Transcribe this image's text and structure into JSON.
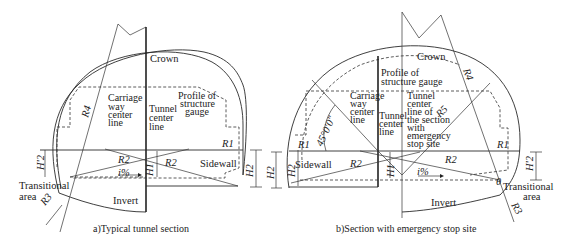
{
  "figure_a": {
    "caption": "a)Typical tunnel section",
    "labels": {
      "crown": "Crown",
      "carriage_way": [
        "Carriage",
        "way",
        "center",
        "line"
      ],
      "tunnel_center": [
        "Tunnel",
        "center",
        "line"
      ],
      "profile": [
        "Profile of",
        "structure",
        "gauge"
      ],
      "sidewall": "Sidewall",
      "transitional": [
        "Transitional",
        "area"
      ],
      "invert": "Invert",
      "slope": "i%",
      "r1": "R1",
      "r2_left": "R2",
      "r2_right": "R2",
      "r3": "R3",
      "r4": "R4",
      "h1": "H1",
      "h2": "H2",
      "h2_prime": "H'2",
      "h2_outer": "H2"
    }
  },
  "figure_b": {
    "caption": "b)Section with emergency stop site",
    "labels": {
      "crown": "Crown",
      "profile": [
        "Profile of",
        "structure gauge"
      ],
      "carriage_way": [
        "Carriage",
        "way",
        "center",
        "line"
      ],
      "tunnel_center": [
        "Tunnel",
        "center",
        "line"
      ],
      "tunnel_center_emergency": [
        "Tunnel",
        "center",
        "line of",
        "the section",
        "with",
        "emergency",
        "stop site"
      ],
      "angle": "45°0′0″",
      "sidewall": "Sidewall",
      "transitional": [
        "Transitional",
        "area"
      ],
      "invert": "Invert",
      "slope": "i%",
      "theta": "θ",
      "r1_left": "R1",
      "r1_right": "R1",
      "r2_left": "R2",
      "r2_right": "R2",
      "r3": "R3",
      "r4": "R4",
      "r5": "R5",
      "h1": "H1",
      "h2": "H2",
      "h2_prime": "H'2"
    }
  }
}
